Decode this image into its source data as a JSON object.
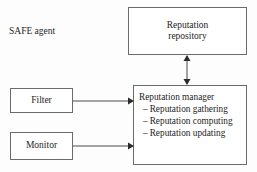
{
  "diagram": {
    "title_label": "SAFE agent",
    "nodes": {
      "repository": {
        "line1": "Reputation",
        "line2": "repository"
      },
      "filter": {
        "label": "Filter"
      },
      "monitor": {
        "label": "Monitor"
      },
      "manager": {
        "heading": "Reputation manager",
        "dash": "–",
        "items": [
          "Reputation gathering",
          "Reputation computing",
          "Reputation updating"
        ]
      }
    },
    "connectors": {
      "filter_to_manager": "arrow-right",
      "monitor_to_manager": "arrow-right",
      "manager_to_repository": "arrow-double-vertical"
    },
    "colors": {
      "box_border": "#6b6b6b",
      "box_fill": "#ffffff",
      "line": "#4a4a4a",
      "text": "#1d1d1d",
      "background": "#fdfdfd"
    }
  }
}
